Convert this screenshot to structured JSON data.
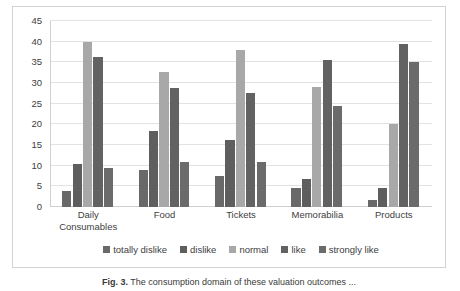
{
  "chart_data": {
    "type": "bar",
    "title": "",
    "xlabel": "",
    "ylabel": "",
    "ylim": [
      0,
      45
    ],
    "ytick_step": 5,
    "yticks": [
      45,
      40,
      35,
      30,
      25,
      20,
      15,
      10,
      5,
      0
    ],
    "grid": true,
    "legend_position": "bottom",
    "categories": [
      "Daily Consumables",
      "Food",
      "Tickets",
      "Memorabilia",
      "Products"
    ],
    "series": [
      {
        "name": "totally dislike",
        "color": "#696969",
        "values": [
          3.8,
          9.0,
          7.5,
          4.5,
          1.6
        ]
      },
      {
        "name": "dislike",
        "color": "#5e5e5e",
        "values": [
          10.3,
          18.5,
          16.3,
          6.8,
          4.5
        ]
      },
      {
        "name": "normal",
        "color": "#a8a8a8",
        "values": [
          40.0,
          32.7,
          38.0,
          29.0,
          20.0
        ]
      },
      {
        "name": "like",
        "color": "#626262",
        "values": [
          36.2,
          28.8,
          27.7,
          35.5,
          39.5
        ]
      },
      {
        "name": "strongly like",
        "color": "#6b6b6b",
        "values": [
          9.5,
          11.0,
          11.0,
          24.5,
          35.0
        ]
      }
    ]
  },
  "caption": {
    "label": "Fig. 3.",
    "text": "The consumption domain of these valuation outcomes ..."
  },
  "colors": {
    "gridline": "#e2e2e2",
    "axis": "#d0d0d0",
    "frame_border": "#d2d2d2",
    "text": "#404040",
    "background": "#ffffff"
  }
}
